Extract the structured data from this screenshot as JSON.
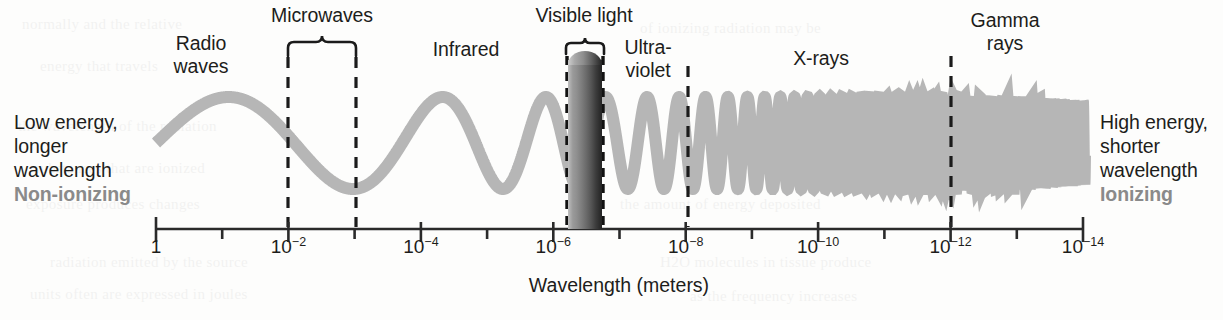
{
  "figure": {
    "type": "electromagnetic-spectrum-diagram",
    "axis_title": "Wavelength (meters)",
    "background_color": "#fdfdfc",
    "wave_color": "#b6b6b6",
    "ionizing_text_color": "#8a8a8a"
  },
  "left_annotation": {
    "lines": "Low energy,\nlonger\nwavelength",
    "emphasis": "Non-ionizing"
  },
  "right_annotation": {
    "lines": "High energy,\nshorter\nwavelength",
    "emphasis": "Ionizing"
  },
  "band_labels": [
    {
      "name": "radio-waves",
      "text": "Radio\nwaves",
      "x": 201,
      "y": 32
    },
    {
      "name": "microwaves",
      "text": "Microwaves",
      "x": 322,
      "y": 4
    },
    {
      "name": "infrared",
      "text": "Infrared",
      "x": 466,
      "y": 38
    },
    {
      "name": "visible-light",
      "text": "Visible light",
      "x": 584,
      "y": 4
    },
    {
      "name": "ultraviolet",
      "text": "Ultra-\nviolet",
      "x": 648,
      "y": 36
    },
    {
      "name": "x-rays",
      "text": "X-rays",
      "x": 821,
      "y": 47
    },
    {
      "name": "gamma-rays",
      "text": "Gamma\nrays",
      "x": 1005,
      "y": 9
    }
  ],
  "axis": {
    "x_start": 156,
    "x_end": 1083,
    "y": 229,
    "major_tick_labels": [
      "1",
      "10-2",
      "10-4",
      "10-6",
      "10-8",
      "10-10",
      "10-12",
      "10-14"
    ],
    "major_tick_exponents": [
      0,
      -2,
      -4,
      -6,
      -8,
      -10,
      -12,
      -14
    ],
    "minor_ticks_between": 1,
    "tick_label_y": 236
  },
  "divider_lines": [
    {
      "name": "microwave-start",
      "x": 288
    },
    {
      "name": "microwave-end",
      "x": 356
    },
    {
      "name": "uv-xray",
      "x": 688
    },
    {
      "name": "xray-gamma",
      "x": 951
    }
  ],
  "braces": [
    {
      "name": "microwaves-brace",
      "x1": 288,
      "x2": 356,
      "y": 42
    },
    {
      "name": "visible-light-brace",
      "x1": 566,
      "x2": 604,
      "y": 42
    }
  ],
  "visible_band": {
    "x": 568,
    "width": 34,
    "top": 51,
    "bottom": 229,
    "gradient": "violet-to-red greyscale column"
  },
  "bleed_through": [
    {
      "text": "normally  and  the  relative",
      "x": 22,
      "y": 16,
      "size": 15
    },
    {
      "text": "energy  that  travels",
      "x": 40,
      "y": 58,
      "size": 15
    },
    {
      "text": "the  wavelength  of  the  radiation",
      "x": 18,
      "y": 118,
      "size": 15
    },
    {
      "text": "substances  that  are  ionized",
      "x": 34,
      "y": 160,
      "size": 15
    },
    {
      "text": "exposure  produces  changes",
      "x": 26,
      "y": 196,
      "size": 15
    },
    {
      "text": "radiation  emitted  by  the  source",
      "x": 50,
      "y": 254,
      "size": 15
    },
    {
      "text": "units  often  are  expressed  in  joules",
      "x": 30,
      "y": 286,
      "size": 15
    },
    {
      "text": "of  ionizing  radiation  may  be",
      "x": 640,
      "y": 20,
      "size": 15
    },
    {
      "text": "wavelengths  shorter  than",
      "x": 700,
      "y": 140,
      "size": 15
    },
    {
      "text": "the  amount  of  energy  deposited",
      "x": 620,
      "y": 196,
      "size": 15
    },
    {
      "text": "H2O  molecules  in  tissue  produce",
      "x": 660,
      "y": 254,
      "size": 15
    },
    {
      "text": "as  the  frequency  increases",
      "x": 690,
      "y": 288,
      "size": 15
    }
  ],
  "chart_data": {
    "type": "line",
    "xlabel": "Wavelength (meters)",
    "ylabel": "",
    "xscale": "log (decreasing left to right)",
    "xlim": [
      "1",
      "10-14"
    ],
    "grid": false,
    "legend": "none",
    "regions": [
      {
        "label": "Radio waves",
        "from": "1",
        "to": "10-2",
        "ionizing": false
      },
      {
        "label": "Microwaves",
        "from": "10-2",
        "to": "10-3",
        "ionizing": false
      },
      {
        "label": "Infrared",
        "from": "10-3",
        "to": "10-6",
        "ionizing": false
      },
      {
        "label": "Visible light",
        "from": "10-6",
        "to": "10-6.5",
        "ionizing": false
      },
      {
        "label": "Ultraviolet",
        "from": "10-6.5",
        "to": "10-8",
        "ionizing": false
      },
      {
        "label": "X-rays",
        "from": "10-8",
        "to": "10-12",
        "ionizing": true
      },
      {
        "label": "Gamma rays",
        "from": "10-12",
        "to": "10-14",
        "ionizing": true
      }
    ],
    "annotations": [
      "Low energy, longer wavelength",
      "Non-ionizing",
      "High energy, shorter wavelength",
      "Ionizing"
    ]
  }
}
